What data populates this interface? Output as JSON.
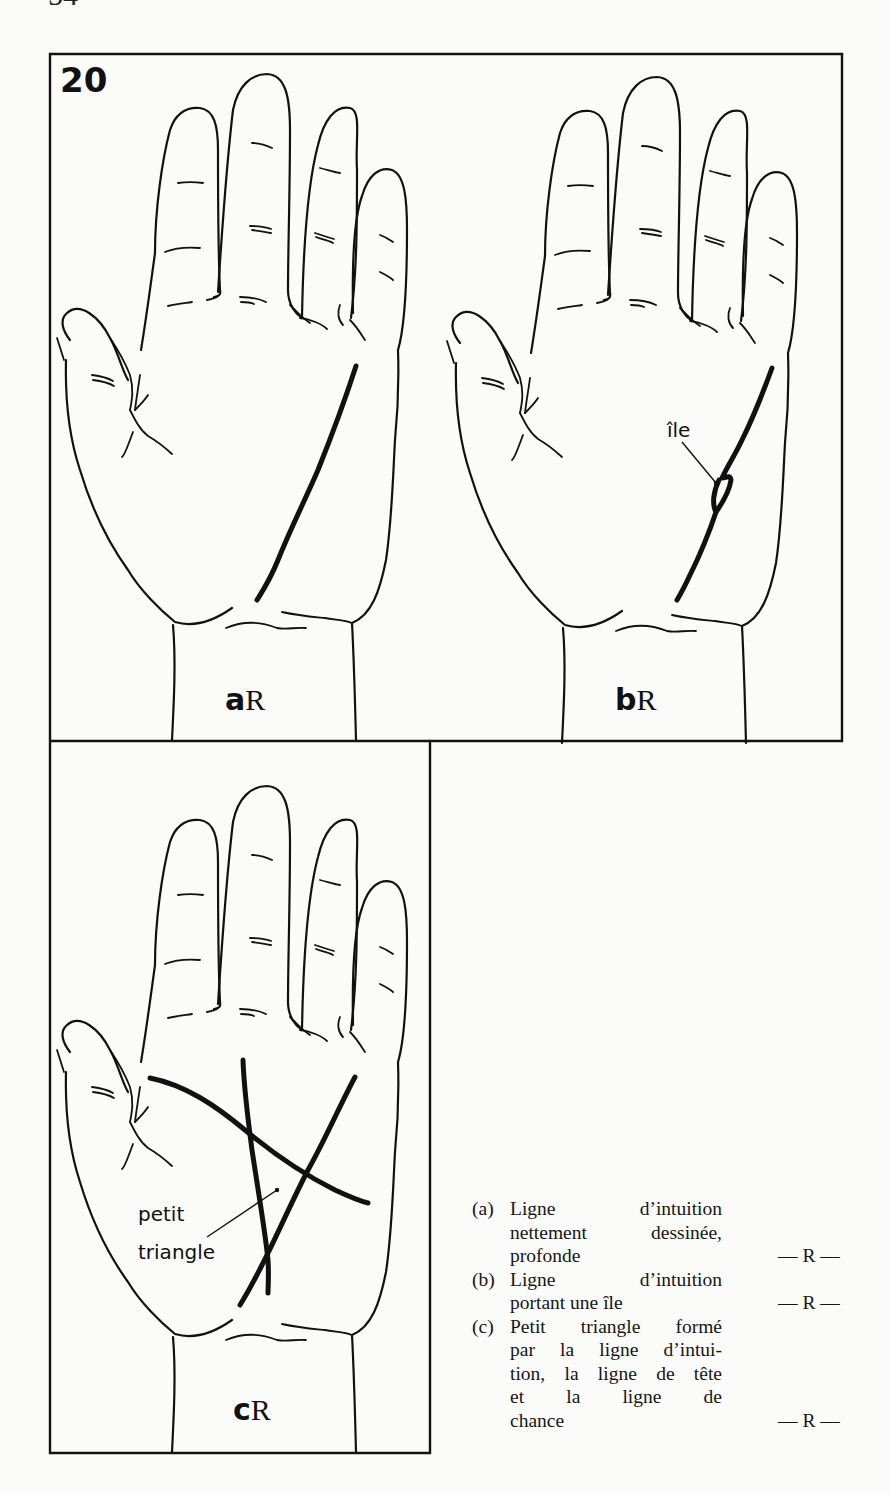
{
  "page": {
    "number": "54"
  },
  "figure": {
    "number": "20",
    "panels": [
      {
        "id": "a",
        "letter": "a",
        "suffix": "R",
        "annotation": ""
      },
      {
        "id": "b",
        "letter": "b",
        "suffix": "R",
        "annotation": "île"
      },
      {
        "id": "c",
        "letter": "c",
        "suffix": "R",
        "annotation_line1": "petit",
        "annotation_line2": "triangle"
      }
    ]
  },
  "legend": {
    "items": [
      {
        "key": "(a)",
        "lines": [
          "Ligne d’intuition",
          "nettement dessinée,",
          "profonde"
        ],
        "mark": "— R —"
      },
      {
        "key": "(b)",
        "lines": [
          "Ligne d’intuition",
          "portant une île"
        ],
        "mark": "— R —"
      },
      {
        "key": "(c)",
        "lines": [
          "Petit triangle formé",
          "par la ligne d’intui-",
          "tion, la ligne de tête",
          "et la ligne de",
          "chance"
        ],
        "mark": "— R —"
      }
    ]
  }
}
